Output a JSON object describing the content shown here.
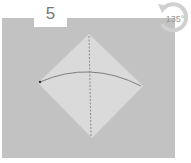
{
  "step": {
    "number": "5"
  },
  "rotation": {
    "label": "135°",
    "direction": "counterclockwise",
    "icon": "rotate-arrow-icon"
  },
  "diagram": {
    "shape": "diamond",
    "fold_lines": [
      "vertical dashed valley line",
      "curved arrow from left corner to right corner"
    ],
    "colors": {
      "panel": "#c2c2c2",
      "paper": "#d9d9d9",
      "line": "#666666"
    }
  }
}
